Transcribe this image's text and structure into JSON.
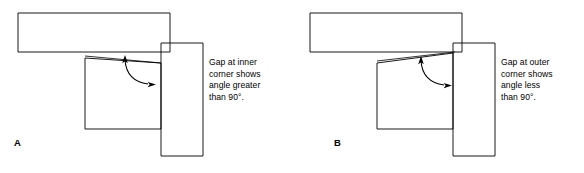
{
  "figure": {
    "type": "technical-diagram",
    "background_color": "#ffffff",
    "line_color": "#000000",
    "panel_count": 2
  },
  "panels": [
    {
      "id": "A",
      "letter": "A",
      "caption": "Gap at inner\ncorner shows\nangle greater\nthan 90°.",
      "caption_lines": [
        "Gap at inner",
        "corner shows",
        "angle greater",
        "than 90°."
      ],
      "gap_location": "inner corner",
      "angle_description": "greater than 90°",
      "angle_value": "90°",
      "wedge_direction": "narrows toward left",
      "arrow": {
        "name": "double-headed-curved-arrow",
        "head_one": "up, pointing at gap line",
        "head_two": "right, pointing at vertical blade"
      },
      "shapes": {
        "horizontal_bar": {
          "x": 18,
          "y": 13,
          "width": 152,
          "height": 39
        },
        "vertical_block": {
          "x": 161,
          "y": 43,
          "width": 42,
          "height": 113
        },
        "lower_rect": {
          "x": 85,
          "y": 58,
          "width": 76,
          "height": 71
        }
      }
    },
    {
      "id": "B",
      "letter": "B",
      "caption": "Gap at outer\ncorner shows\nangle less\nthan 90°.",
      "caption_lines": [
        "Gap at outer",
        "corner shows",
        "angle less",
        "than 90°."
      ],
      "gap_location": "outer corner",
      "angle_description": "less than 90°",
      "angle_value": "90°",
      "wedge_direction": "narrows toward right",
      "arrow": {
        "name": "double-headed-curved-arrow",
        "head_one": "up, pointing at gap line",
        "head_two": "right, pointing at vertical blade"
      },
      "shapes": {
        "horizontal_bar": {
          "x": 18,
          "y": 13,
          "width": 152,
          "height": 39
        },
        "vertical_block": {
          "x": 161,
          "y": 43,
          "width": 42,
          "height": 113
        },
        "lower_rect": {
          "x": 85,
          "y": 58,
          "width": 76,
          "height": 71
        }
      }
    }
  ]
}
